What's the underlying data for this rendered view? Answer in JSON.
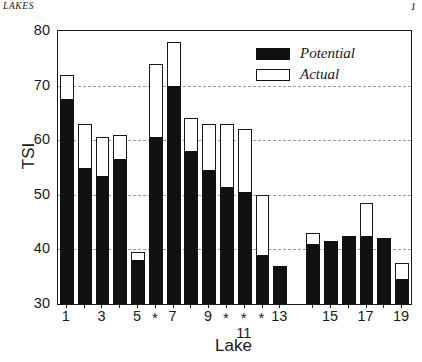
{
  "running_head": {
    "left_text": "LAKES",
    "page_number": "1"
  },
  "chart_data": {
    "type": "bar",
    "title": "",
    "subtitle": "",
    "xlabel": "Lake",
    "ylabel": "TSI",
    "ylim": [
      30,
      80
    ],
    "ytick_values": [
      30,
      40,
      50,
      60,
      70,
      80
    ],
    "ytick_labels": [
      "30",
      "40",
      "50",
      "60",
      "70",
      "80"
    ],
    "grid": "horizontal-dashed",
    "gridline_values": [
      40,
      50,
      60,
      70
    ],
    "legend_position": "top-right-inside",
    "bar_style": "overlay",
    "categories": [
      1,
      2,
      3,
      4,
      5,
      6,
      7,
      8,
      9,
      10,
      11,
      12,
      13,
      14,
      15,
      16,
      17,
      18,
      19
    ],
    "xtick_labels": [
      "1",
      "",
      "3",
      "",
      "5",
      "*",
      "7",
      "",
      "9",
      "*",
      "*",
      "*",
      "13",
      "",
      "15",
      "",
      "17",
      "",
      "19"
    ],
    "xtick_label_below": {
      "index": 10,
      "text": "11"
    },
    "group_gap_after_category": 13,
    "series": [
      {
        "name": "Potential",
        "fill": "#111111",
        "values": [
          67.5,
          55.0,
          53.5,
          56.5,
          38.0,
          60.5,
          70.0,
          58.0,
          54.5,
          51.5,
          50.5,
          39.0,
          37.0,
          41.0,
          41.5,
          42.5,
          42.5,
          42.0,
          34.5
        ]
      },
      {
        "name": "Actual",
        "fill": "#ffffff",
        "values": [
          72.0,
          63.0,
          60.5,
          61.0,
          39.5,
          74.0,
          78.0,
          64.0,
          63.0,
          63.0,
          62.0,
          50.0,
          37.0,
          43.0,
          41.5,
          42.5,
          48.5,
          42.0,
          37.5
        ]
      }
    ],
    "legend_entries": [
      {
        "label": "Potential",
        "swatch": "filled"
      },
      {
        "label": "Actual",
        "swatch": "hollow"
      }
    ]
  },
  "colors": {
    "axis": "#1a1a1a",
    "grid": "#9a9a9a",
    "potential": "#111111",
    "actual": "#ffffff",
    "background": "#ffffff"
  }
}
